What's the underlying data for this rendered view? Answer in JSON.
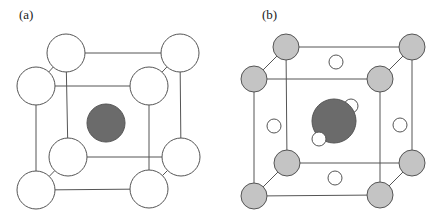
{
  "panels": [
    {
      "label": "(a)",
      "label_pos": [
        19,
        19
      ],
      "colors": {
        "corner": "#ffffff",
        "center": "#6b6b6b",
        "stroke": "#555555"
      },
      "corners": {
        "back": [
          [
            66,
            53
          ],
          [
            180,
            53
          ],
          [
            181,
            157
          ],
          [
            68,
            157
          ]
        ],
        "front": [
          [
            36,
            86
          ],
          [
            149,
            86
          ],
          [
            149,
            189
          ],
          [
            36,
            190
          ]
        ],
        "radius": 19
      },
      "center_atom": {
        "x": 106,
        "y": 123,
        "r": 19
      },
      "face_atoms": [],
      "interstitials": []
    },
    {
      "label": "(b)",
      "label_pos": [
        262,
        19
      ],
      "colors": {
        "corner": "#c4c4c4",
        "center": "#6b6b6b",
        "face": "#ffffff",
        "stroke": "#555555"
      },
      "corners": {
        "back": [
          [
            286,
            47
          ],
          [
            412,
            47
          ],
          [
            412,
            163
          ],
          [
            287,
            163
          ]
        ],
        "front": [
          [
            254,
            79
          ],
          [
            380,
            79
          ],
          [
            380,
            195
          ],
          [
            254,
            196
          ]
        ],
        "radius": 13
      },
      "center_atom": {
        "x": 334,
        "y": 121,
        "r": 22
      },
      "face_atoms": [
        {
          "x": 336,
          "y": 62,
          "r": 7
        },
        {
          "x": 274,
          "y": 126,
          "r": 7
        },
        {
          "x": 400,
          "y": 125,
          "r": 7
        },
        {
          "x": 335,
          "y": 178,
          "r": 7
        }
      ],
      "interstitials": [
        {
          "x": 351,
          "y": 106,
          "r": 7
        },
        {
          "x": 319,
          "y": 139,
          "r": 7
        }
      ]
    }
  ]
}
